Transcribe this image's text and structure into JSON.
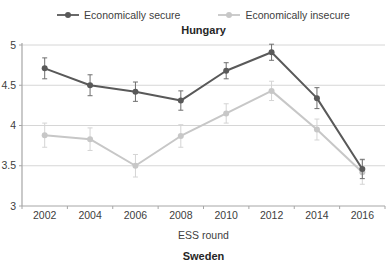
{
  "chart_data": {
    "type": "line",
    "title": "Hungary",
    "xlabel": "ESS round",
    "next_panel_title": "Sweden",
    "categories": [
      "2002",
      "2004",
      "2006",
      "2008",
      "2010",
      "2012",
      "2014",
      "2016"
    ],
    "ylim": [
      3,
      5
    ],
    "yticks": [
      3,
      3.5,
      4,
      4.5,
      5
    ],
    "grid": true,
    "legend_position": "top",
    "series": [
      {
        "name": "Economically secure",
        "color": "#595959",
        "error_color": "#6e6e6e",
        "values": [
          4.71,
          4.5,
          4.42,
          4.31,
          4.68,
          4.91,
          4.34,
          3.46
        ],
        "errors": [
          0.13,
          0.13,
          0.12,
          0.12,
          0.1,
          0.1,
          0.13,
          0.12
        ]
      },
      {
        "name": "Economically insecure",
        "color": "#c7c7c7",
        "error_color": "#d4d4d4",
        "values": [
          3.88,
          3.83,
          3.5,
          3.87,
          4.15,
          4.43,
          3.95,
          3.42
        ],
        "errors": [
          0.15,
          0.14,
          0.14,
          0.14,
          0.12,
          0.12,
          0.13,
          0.15
        ]
      }
    ],
    "style": {
      "grid_color": "#d6d6d6",
      "axis_color": "#a6a6a6",
      "tick_label_color": "#404040"
    }
  }
}
